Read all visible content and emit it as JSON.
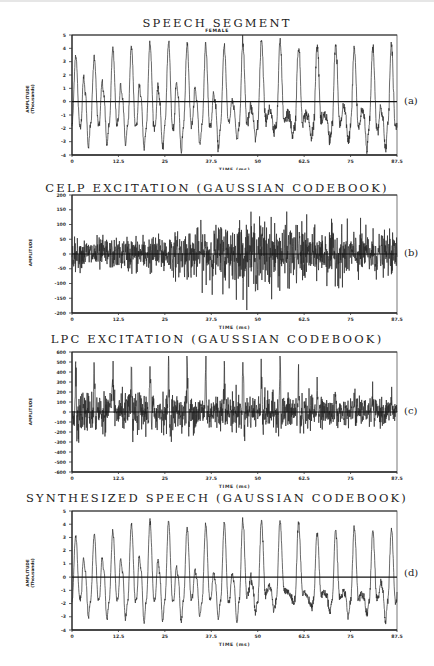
{
  "chart_data": [
    {
      "id": "a",
      "type": "line",
      "title": "SPEECH SEGMENT",
      "subtitle": "FEMALE",
      "panel_label": "(a)",
      "xlabel": "TIME (ms)",
      "ylabel": "AMPLITUDE",
      "ylabel_sub": "(Thousands)",
      "xlim": [
        0,
        87.5
      ],
      "ylim": [
        -4,
        5
      ],
      "xticks": [
        "0",
        "12.5",
        "25",
        "37.5",
        "50",
        "62.5",
        "75",
        "87.5"
      ],
      "yticks": [
        "5",
        "4",
        "3",
        "2",
        "1",
        "0",
        "-1",
        "-2",
        "-3",
        "-4"
      ],
      "grid": false,
      "zero_line": true,
      "waveform": "voiced",
      "pitch_period_ms": 5.0,
      "cycle_peaks": [
        3.5,
        3.4,
        3.9,
        4.1,
        4.4,
        4.5,
        4.3,
        4.2,
        4.2,
        4.3,
        4.6,
        4.5,
        4.2,
        4.3,
        4.2,
        4.0,
        4.1,
        4.1
      ],
      "cycle_troughs": [
        -3.3,
        -3.2,
        -3.1,
        -3.5,
        -3.6,
        -3.8,
        -3.2,
        -3.5,
        -2.8,
        -2.9,
        -2.4,
        -2.5,
        -2.7,
        -2.9,
        -3.1,
        -3.5,
        -3.7,
        -3.6
      ],
      "secondary_peaks": [
        1.8,
        1.5,
        1.3,
        1.3,
        1.1,
        1.4,
        1.0,
        0.6,
        0.2,
        -0.4,
        -0.5,
        -0.8,
        -0.9,
        -1.0,
        -0.4,
        -0.6,
        -0.5,
        0.2
      ],
      "noise": 0.15
    },
    {
      "id": "b",
      "type": "line",
      "title": "CELP EXCITATION (GAUSSIAN CODEBOOK)",
      "subtitle": "",
      "panel_label": "(b)",
      "xlabel": "TIME (ms)",
      "ylabel": "AMPLITUDE",
      "ylabel_sub": "",
      "xlim": [
        0,
        87.5
      ],
      "ylim": [
        -200,
        200
      ],
      "xticks": [
        "0",
        "12.5",
        "25",
        "37.5",
        "50",
        "62.5",
        "75",
        "87.5"
      ],
      "yticks": [
        "200",
        "150",
        "100",
        "50",
        "0",
        "-50",
        "-100",
        "-150",
        "-200"
      ],
      "grid": false,
      "zero_line": true,
      "waveform": "noise",
      "envelope": [
        45,
        50,
        45,
        55,
        55,
        65,
        75,
        80,
        95,
        100,
        105,
        95,
        90,
        70,
        80,
        75,
        70,
        60
      ],
      "max_observed": 165,
      "min_observed": -190
    },
    {
      "id": "c",
      "type": "line",
      "title": "LPC EXCITATION (GAUSSIAN CODEBOOK)",
      "subtitle": "",
      "panel_label": "(c)",
      "xlabel": "TIME (ms)",
      "ylabel": "AMPLITUDE",
      "ylabel_sub": "",
      "xlim": [
        0,
        87.5
      ],
      "ylim": [
        -600,
        600
      ],
      "xticks": [
        "0",
        "12.5",
        "25",
        "37.5",
        "50",
        "62.5",
        "75",
        "87.5"
      ],
      "yticks": [
        "600",
        "500",
        "400",
        "300",
        "200",
        "100",
        "0",
        "-100",
        "-200",
        "-300",
        "-400",
        "-500",
        "-600"
      ],
      "grid": false,
      "zero_line": true,
      "waveform": "pulse_noise",
      "pitch_period_ms": 5.0,
      "pulse_peaks": [
        520,
        530,
        460,
        470,
        520,
        470,
        500,
        430,
        560,
        550,
        540,
        530,
        360,
        230,
        200,
        210,
        220,
        210
      ],
      "envelope": [
        170,
        160,
        150,
        160,
        160,
        150,
        150,
        150,
        160,
        150,
        150,
        150,
        150,
        120,
        110,
        110,
        110,
        100
      ],
      "max_observed": 560,
      "min_observed": -520
    },
    {
      "id": "d",
      "type": "line",
      "title": "SYNTHESIZED SPEECH (GAUSSIAN CODEBOOK)",
      "subtitle": "",
      "panel_label": "(d)",
      "xlabel": "TIME (ms)",
      "ylabel": "AMPLITUDE",
      "ylabel_sub": "(Thousands)",
      "xlim": [
        0,
        87.5
      ],
      "ylim": [
        -4,
        5
      ],
      "xticks": [
        "0",
        "12.5",
        "25",
        "37.5",
        "50",
        "62.5",
        "75",
        "87.5"
      ],
      "yticks": [
        "5",
        "4",
        "3",
        "2",
        "1",
        "0",
        "-1",
        "-2",
        "-3",
        "-4"
      ],
      "grid": false,
      "zero_line": true,
      "waveform": "voiced",
      "pitch_period_ms": 5.0,
      "cycle_peaks": [
        3.1,
        3.2,
        3.5,
        4.0,
        4.2,
        4.2,
        3.8,
        4.0,
        4.1,
        4.3,
        4.3,
        4.2,
        4.1,
        3.4,
        3.5,
        3.8,
        3.5,
        3.6
      ],
      "cycle_troughs": [
        -3.0,
        -3.2,
        -3.2,
        -3.4,
        -3.3,
        -3.4,
        -3.0,
        -3.1,
        -3.5,
        -2.7,
        -2.5,
        -1.8,
        -2.2,
        -2.7,
        -3.0,
        -2.8,
        -3.3,
        -3.5
      ],
      "secondary_peaks": [
        1.4,
        1.5,
        1.4,
        1.5,
        1.3,
        0.8,
        0.6,
        0.3,
        0.3,
        0.0,
        -0.6,
        -1.1,
        -1.4,
        -1.2,
        -1.1,
        -1.2,
        -0.4,
        0.2
      ],
      "noise": 0.1
    }
  ]
}
